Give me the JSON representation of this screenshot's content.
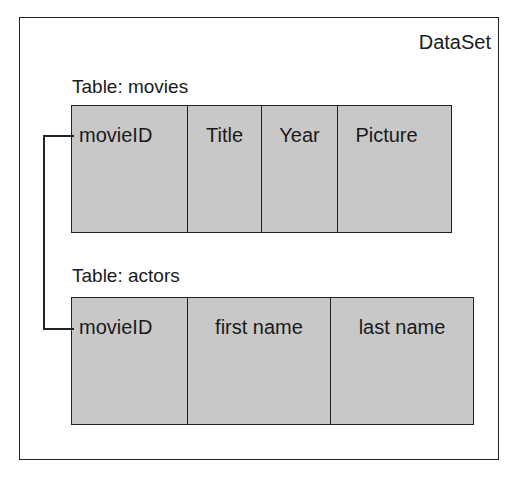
{
  "dataset": {
    "label": "DataSet"
  },
  "tables": [
    {
      "label": "Table: movies",
      "columns": [
        "movieID",
        "Title",
        "Year",
        "Picture"
      ]
    },
    {
      "label": "Table: actors",
      "columns": [
        "movieID",
        "first name",
        "last name"
      ]
    }
  ],
  "relation": {
    "from": "movies.movieID",
    "to": "actors.movieID"
  },
  "colors": {
    "cell_fill": "#c8c8c8",
    "stroke": "#222222"
  }
}
